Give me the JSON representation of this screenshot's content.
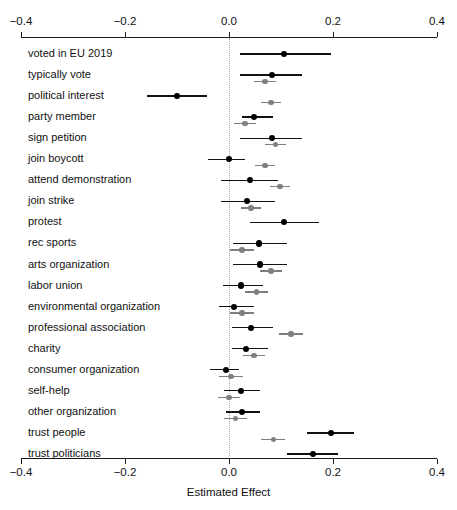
{
  "chart_data": {
    "type": "scatter",
    "subtype": "forest-plot",
    "title": "",
    "xlabel": "Estimated Effect",
    "ylabel": "",
    "xlim": [
      -0.4,
      0.4
    ],
    "xticks": [
      -0.4,
      -0.2,
      0.0,
      0.2,
      0.4
    ],
    "xtick_labels": [
      "-0.4",
      "-0.2",
      "0.0",
      "0.2",
      "0.4"
    ],
    "grid": false,
    "legend": "none",
    "reference_line": 0.0,
    "reference_line_style": "dotted",
    "colors": {
      "series_1": "#000000",
      "series_2": "#808080",
      "axis": "#1a1a1a",
      "reference": "#a8a8a8"
    },
    "categories": [
      "voted in EU 2019",
      "typically vote",
      "political interest",
      "party member",
      "sign petition",
      "join boycott",
      "attend demonstration",
      "join strike",
      "protest",
      "rec sports",
      "arts organization",
      "labor union",
      "environmental organization",
      "professional association",
      "charity",
      "consumer organization",
      "self-help",
      "other organization",
      "trust people",
      "trust politicians"
    ],
    "series": [
      {
        "name": "series_1",
        "color": "#000000",
        "estimates": [
          0.106,
          0.083,
          -0.1,
          0.048,
          0.083,
          0.0,
          0.04,
          0.035,
          0.106,
          0.058,
          0.06,
          0.023,
          0.01,
          0.042,
          0.033,
          -0.006,
          0.023,
          0.025,
          0.196,
          0.162
        ],
        "ci_low": [
          0.021,
          0.021,
          -0.158,
          0.025,
          0.021,
          -0.04,
          -0.015,
          -0.016,
          0.04,
          0.008,
          0.008,
          -0.012,
          -0.02,
          0.006,
          0.006,
          -0.037,
          -0.01,
          -0.006,
          0.15,
          0.112
        ],
        "ci_high": [
          0.196,
          0.14,
          -0.042,
          0.085,
          0.14,
          0.031,
          0.095,
          0.088,
          0.173,
          0.112,
          0.112,
          0.065,
          0.048,
          0.085,
          0.075,
          0.019,
          0.06,
          0.06,
          0.24,
          0.21
        ]
      },
      {
        "name": "series_2",
        "color": "#808080",
        "estimates": [
          null,
          0.069,
          0.081,
          0.031,
          0.09,
          0.069,
          0.098,
          0.042,
          null,
          0.025,
          0.081,
          0.053,
          0.025,
          0.119,
          0.048,
          0.004,
          0.0,
          0.012,
          0.085,
          null
        ],
        "ci_low": [
          null,
          0.048,
          0.062,
          0.01,
          0.069,
          0.05,
          0.079,
          0.023,
          null,
          0.002,
          0.06,
          0.031,
          0.002,
          0.096,
          0.027,
          -0.019,
          -0.021,
          -0.01,
          0.062,
          null
        ],
        "ci_high": [
          null,
          0.09,
          0.1,
          0.052,
          0.11,
          0.088,
          0.117,
          0.062,
          null,
          0.048,
          0.102,
          0.075,
          0.048,
          0.142,
          0.069,
          0.027,
          0.021,
          0.034,
          0.108,
          null
        ]
      }
    ]
  },
  "axis": {
    "x_label": "Estimated Effect",
    "tick_labels": [
      "-0.4",
      "-0.2",
      "0.0",
      "0.2",
      "0.4"
    ]
  }
}
